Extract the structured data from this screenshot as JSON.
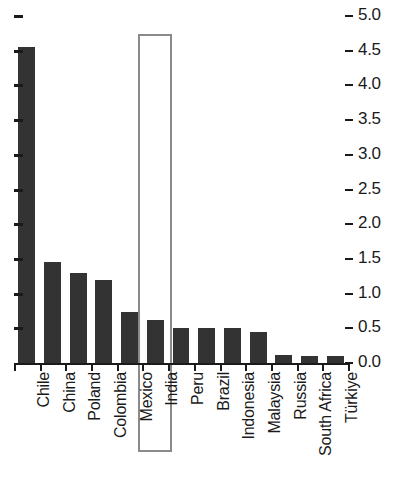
{
  "chart_data": {
    "type": "bar",
    "title": "",
    "subtitle": "",
    "xlabel": "",
    "ylabel": "",
    "ylim": [
      0.0,
      5.0
    ],
    "ytick_step": 0.5,
    "grid": false,
    "legend": null,
    "orientation": "vertical",
    "y_axis_position": "right",
    "x_tick_label_rotation": 90,
    "categories": [
      "Chile",
      "China",
      "Poland",
      "Colombia",
      "Mexico",
      "India",
      "Peru",
      "Brazil",
      "Indonesia",
      "Malaysia",
      "Russia",
      "South Africa",
      "Türkiye"
    ],
    "values": [
      4.55,
      1.46,
      1.3,
      1.2,
      0.74,
      0.62,
      0.5,
      0.5,
      0.5,
      0.45,
      0.11,
      0.1,
      0.1
    ],
    "ytick_labels": [
      "5.0",
      "4.5",
      "4.0",
      "3.5",
      "3.0",
      "2.5",
      "2.0",
      "1.5",
      "1.0",
      "0.5",
      "0.0"
    ],
    "ytick_values": [
      5.0,
      4.5,
      4.0,
      3.5,
      3.0,
      2.5,
      2.0,
      1.5,
      1.0,
      0.5,
      0.0
    ],
    "annotations": [
      {
        "type": "highlight-rectangle",
        "target_category": "India",
        "label": "India"
      }
    ],
    "colors": {
      "bar": "#333333",
      "axis": "#1a1a1a",
      "text": "#1a1a1a",
      "highlight_border": "#8a8a8a",
      "background": "#ffffff"
    }
  }
}
